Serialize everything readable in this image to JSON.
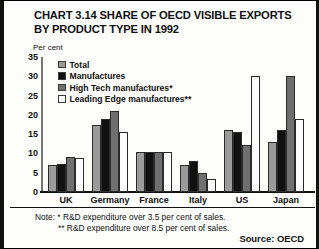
{
  "chart_data": {
    "type": "bar",
    "title": "CHART 3.14 SHARE OF OECD VISIBLE EXPORTS BY PRODUCT TYPE IN 1992",
    "xlabel": "",
    "ylabel": "Per cent",
    "ylim": [
      0,
      35
    ],
    "yticks": [
      0,
      5,
      10,
      15,
      20,
      25,
      30,
      35
    ],
    "grid": false,
    "legend_position": "top-left-inside",
    "categories": [
      "UK",
      "Germany",
      "France",
      "Italy",
      "US",
      "Japan"
    ],
    "series": [
      {
        "name": "Total",
        "color": "#9b9b9b",
        "values": [
          7.0,
          17.5,
          10.3,
          7.0,
          16.0,
          13.0
        ]
      },
      {
        "name": "Manufactures",
        "color": "#111111",
        "values": [
          7.2,
          19.0,
          10.5,
          8.0,
          15.5,
          16.0
        ]
      },
      {
        "name": "High Tech manufactures*",
        "color": "#6f6f6f",
        "values": [
          9.0,
          21.0,
          10.3,
          5.0,
          12.3,
          30.0
        ]
      },
      {
        "name": "Leading Edge manufactures**",
        "color": "#ffffff",
        "values": [
          8.7,
          15.5,
          10.5,
          3.5,
          30.0,
          19.0
        ]
      }
    ],
    "annotations": [
      "Note: * R&D expenditure over 3.5 per cent of sales.",
      "** R&D expenditure over 8.5 per cent of sales."
    ],
    "source": "Source: OECD"
  },
  "yticks": {
    "t0": "0",
    "t1": "5",
    "t2": "10",
    "t3": "15",
    "t4": "20",
    "t5": "25",
    "t6": "30",
    "t7": "35"
  },
  "xlabels": {
    "c0": "UK",
    "c1": "Germany",
    "c2": "France",
    "c3": "Italy",
    "c4": "US",
    "c5": "Japan"
  },
  "legend": {
    "l0": "Total",
    "l1": "Manufactures",
    "l2": "High Tech manufactures*",
    "l3": "Leading Edge manufactures**"
  },
  "notes": {
    "line1": "Note: * R&D expenditure over 3.5 per cent of sales.",
    "line2": "** R&D expenditure over 8.5 per cent of sales.",
    "source": "Source: OECD"
  }
}
